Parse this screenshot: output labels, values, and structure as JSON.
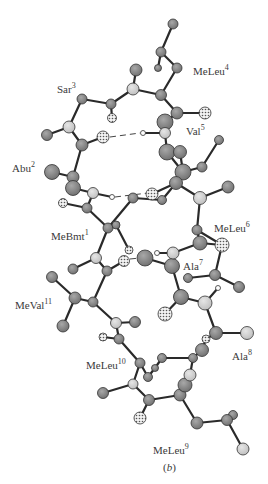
{
  "figure": {
    "caption": "(b)",
    "caption_letter": "b",
    "residue_labels": [
      {
        "name": "Sar",
        "num": "3",
        "x": 57,
        "y": 82
      },
      {
        "name": "MeLeu",
        "num": "4",
        "x": 193,
        "y": 64
      },
      {
        "name": "Val",
        "num": "5",
        "x": 186,
        "y": 124
      },
      {
        "name": "Abu",
        "num": "2",
        "x": 12,
        "y": 161
      },
      {
        "name": "MeBmt",
        "num": "1",
        "x": 51,
        "y": 229
      },
      {
        "name": "MeLeu",
        "num": "6",
        "x": 214,
        "y": 221
      },
      {
        "name": "Ala",
        "num": "7",
        "x": 183,
        "y": 259
      },
      {
        "name": "MeVal",
        "num": "11",
        "x": 15,
        "y": 298
      },
      {
        "name": "MeLeu",
        "num": "10",
        "x": 86,
        "y": 358
      },
      {
        "name": "Ala",
        "num": "8",
        "x": 232,
        "y": 349
      },
      {
        "name": "MeLeu",
        "num": "9",
        "x": 153,
        "y": 443
      }
    ],
    "colors": {
      "bond": "#2a2a2a",
      "carbon": "#8a8a8a",
      "carbon_front": "#777777",
      "nitrogen": "#cfcfcf",
      "oxygen_bg": "#f0f0f0",
      "oxygen_dot": "#555555",
      "hydrogen": "#ffffff",
      "text": "#3a3a3a"
    }
  }
}
